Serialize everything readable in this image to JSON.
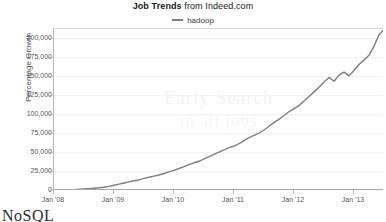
{
  "title": {
    "strong": "Job Trends",
    "rest": " from Indeed.com"
  },
  "legend": {
    "position": "top-center",
    "entries": [
      {
        "label": "hadoop",
        "color": "#7d7d84"
      }
    ]
  },
  "axes": {
    "ylabel": "Percentage Growth",
    "xlabel": "",
    "y_ticks": [
      "0",
      "25,000",
      "50,000",
      "75,000",
      "100,000",
      "125,000",
      "150,000",
      "175,000",
      "200,000"
    ],
    "x_ticks": [
      "Jan '08",
      "Jan '09",
      "Jan '10",
      "Jan '11",
      "Jan '12",
      "Jan '13"
    ]
  },
  "watermark": {
    "line1": "Early Search",
    "line2": "in all jobs"
  },
  "page_text": {
    "clipped_heading": "NoSQL"
  },
  "colors": {
    "line": "#7d7d84",
    "grid": "#efeff2",
    "axis": "#b9b9bd",
    "text": "#555558",
    "background": "#ffffff"
  },
  "chart_data": {
    "type": "line",
    "title": "Job Trends from Indeed.com",
    "xlabel": "",
    "ylabel": "Percentage Growth",
    "xlim": [
      "Jan '08",
      "Jul '13"
    ],
    "ylim": [
      0,
      212500
    ],
    "grid": true,
    "legend_position": "top-center",
    "x_tick_labels": [
      "Jan '08",
      "Jan '09",
      "Jan '10",
      "Jan '11",
      "Jan '12",
      "Jan '13"
    ],
    "y_tick_values": [
      0,
      25000,
      50000,
      75000,
      100000,
      125000,
      150000,
      175000,
      200000
    ],
    "series": [
      {
        "name": "hadoop",
        "color": "#7d7d84",
        "x": [
          "Jan '08",
          "Feb '08",
          "Mar '08",
          "Apr '08",
          "May '08",
          "Jun '08",
          "Jul '08",
          "Aug '08",
          "Sep '08",
          "Oct '08",
          "Nov '08",
          "Dec '08",
          "Jan '09",
          "Feb '09",
          "Mar '09",
          "Apr '09",
          "May '09",
          "Jun '09",
          "Jul '09",
          "Aug '09",
          "Sep '09",
          "Oct '09",
          "Nov '09",
          "Dec '09",
          "Jan '10",
          "Feb '10",
          "Mar '10",
          "Apr '10",
          "May '10",
          "Jun '10",
          "Jul '10",
          "Aug '10",
          "Sep '10",
          "Oct '10",
          "Nov '10",
          "Dec '10",
          "Jan '11",
          "Feb '11",
          "Mar '11",
          "Apr '11",
          "May '11",
          "Jun '11",
          "Jul '11",
          "Aug '11",
          "Sep '11",
          "Oct '11",
          "Nov '11",
          "Dec '11",
          "Jan '12",
          "Feb '12",
          "Mar '12",
          "Apr '12",
          "May '12",
          "Jun '12",
          "Jul '12",
          "Aug '12",
          "Sep '12",
          "Oct '12",
          "Nov '12",
          "Dec '12",
          "Jan '13",
          "Feb '13",
          "Mar '13",
          "Apr '13",
          "May '13",
          "Jun '13",
          "Jul '13"
        ],
        "values": [
          0,
          300,
          700,
          1200,
          1800,
          2200,
          2600,
          3100,
          3600,
          4200,
          5000,
          6000,
          7500,
          9000,
          10500,
          12000,
          13500,
          14500,
          16500,
          18000,
          19500,
          21000,
          23000,
          25000,
          27000,
          29500,
          32000,
          34500,
          37000,
          39000,
          42000,
          45000,
          48000,
          51000,
          54000,
          57000,
          59000,
          62000,
          66000,
          70000,
          73000,
          76000,
          80000,
          85000,
          90000,
          94000,
          99000,
          104000,
          108000,
          112000,
          118000,
          124000,
          130000,
          136000,
          143000,
          149000,
          144000,
          152000,
          156000,
          151000,
          158000,
          166000,
          172000,
          178000,
          190000,
          205000,
          212000
        ]
      }
    ]
  }
}
